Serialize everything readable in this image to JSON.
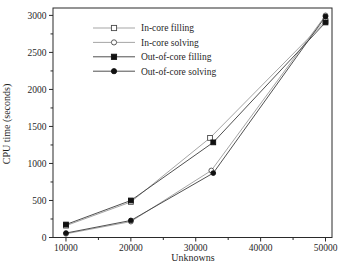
{
  "figure": {
    "background": "#ffffff",
    "frame_color": "#2a2a2a"
  },
  "chart_data": {
    "type": "line",
    "title": "",
    "xlabel": "Unknowns",
    "ylabel": "CPU time (seconds)",
    "xlim": [
      8000,
      51000
    ],
    "ylim": [
      0,
      3100
    ],
    "x_ticks": [
      10000,
      20000,
      30000,
      40000,
      50000
    ],
    "x_minor_ticks": [
      15000,
      25000,
      35000,
      45000
    ],
    "y_ticks": [
      0,
      500,
      1000,
      1500,
      2000,
      2500,
      3000
    ],
    "y_minor_ticks": [
      250,
      750,
      1250,
      1750,
      2250,
      2750
    ],
    "grid": false,
    "legend_position": "top-left-inside",
    "series": [
      {
        "name": "In-core filling",
        "marker": "square-open",
        "line_color": "#9b9b9b",
        "marker_stroke": "#4a4a4a",
        "marker_fill": "#ffffff",
        "x": [
          10000,
          20000,
          32200,
          50000
        ],
        "y": [
          160,
          480,
          1345,
          2925
        ]
      },
      {
        "name": "In-core solving",
        "marker": "circle-open",
        "line_color": "#9b9b9b",
        "marker_stroke": "#4a4a4a",
        "marker_fill": "#ffffff",
        "x": [
          10000,
          20000,
          32400,
          50000
        ],
        "y": [
          50,
          215,
          905,
          3000
        ]
      },
      {
        "name": "Out-of-core filling",
        "marker": "square-filled",
        "line_color": "#3c3c3c",
        "marker_stroke": "#111111",
        "marker_fill": "#111111",
        "x": [
          10000,
          20000,
          32700,
          50000
        ],
        "y": [
          175,
          500,
          1285,
          2905
        ]
      },
      {
        "name": "Out-of-core solving",
        "marker": "circle-filled",
        "line_color": "#3c3c3c",
        "marker_stroke": "#111111",
        "marker_fill": "#111111",
        "x": [
          10000,
          20000,
          32700,
          50000
        ],
        "y": [
          60,
          230,
          870,
          2985
        ]
      }
    ]
  }
}
